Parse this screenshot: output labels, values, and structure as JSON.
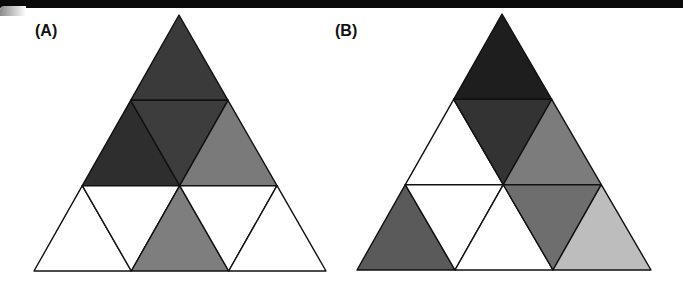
{
  "panels": [
    {
      "id": "A",
      "label": "(A)",
      "apex": [
        179,
        15
      ],
      "base_left": [
        34,
        271
      ],
      "base_right": [
        326,
        271
      ],
      "subdivisions": 3,
      "cells": [
        {
          "row": 0,
          "pos": 0,
          "orientation": "up",
          "fill": "#3a3a3a"
        },
        {
          "row": 1,
          "pos": 0,
          "orientation": "up",
          "fill": "#2e2e2e"
        },
        {
          "row": 1,
          "pos": 1,
          "orientation": "down",
          "fill": "#3d3d3d"
        },
        {
          "row": 1,
          "pos": 2,
          "orientation": "up",
          "fill": "#7a7a7a"
        },
        {
          "row": 2,
          "pos": 0,
          "orientation": "up",
          "fill": "#ffffff"
        },
        {
          "row": 2,
          "pos": 1,
          "orientation": "down",
          "fill": "#ffffff"
        },
        {
          "row": 2,
          "pos": 2,
          "orientation": "up",
          "fill": "#7e7e7e"
        },
        {
          "row": 2,
          "pos": 3,
          "orientation": "down",
          "fill": "#ffffff"
        },
        {
          "row": 2,
          "pos": 4,
          "orientation": "up",
          "fill": "#ffffff"
        }
      ]
    },
    {
      "id": "B",
      "label": "(B)",
      "apex": [
        502,
        14
      ],
      "base_left": [
        357,
        270
      ],
      "base_right": [
        651,
        270
      ],
      "subdivisions": 3,
      "cells": [
        {
          "row": 0,
          "pos": 0,
          "orientation": "up",
          "fill": "#1e1e1e"
        },
        {
          "row": 1,
          "pos": 0,
          "orientation": "up",
          "fill": "#ffffff"
        },
        {
          "row": 1,
          "pos": 1,
          "orientation": "down",
          "fill": "#333333"
        },
        {
          "row": 1,
          "pos": 2,
          "orientation": "up",
          "fill": "#7c7c7c"
        },
        {
          "row": 2,
          "pos": 0,
          "orientation": "up",
          "fill": "#5a5a5a"
        },
        {
          "row": 2,
          "pos": 1,
          "orientation": "down",
          "fill": "#ffffff"
        },
        {
          "row": 2,
          "pos": 2,
          "orientation": "up",
          "fill": "#ffffff"
        },
        {
          "row": 2,
          "pos": 3,
          "orientation": "down",
          "fill": "#6e6e6e"
        },
        {
          "row": 2,
          "pos": 4,
          "orientation": "up",
          "fill": "#bdbdbd"
        }
      ]
    }
  ]
}
